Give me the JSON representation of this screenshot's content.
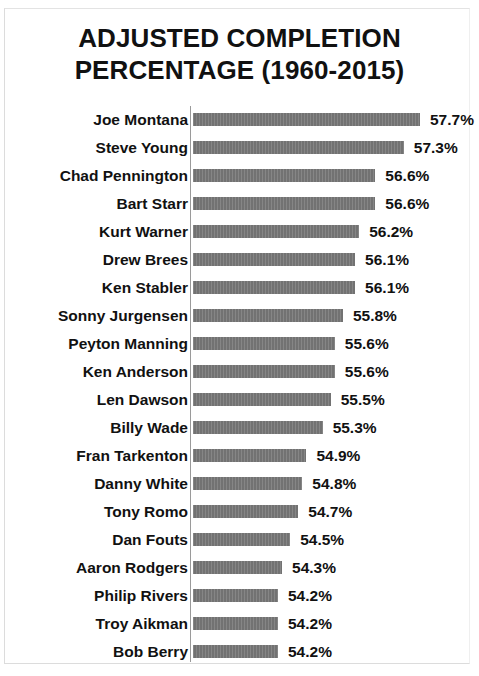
{
  "chart_data": {
    "type": "bar",
    "orientation": "horizontal",
    "title": "ADJUSTED COMPLETION PERCENTAGE (1960-2015)",
    "title_lines": [
      "ADJUSTED COMPLETION",
      "PERCENTAGE (1960-2015)"
    ],
    "xlabel": "",
    "ylabel": "",
    "grid": false,
    "legend": null,
    "axis_min_implied": 52.1,
    "xlim": [
      52.1,
      57.9
    ],
    "bar_color": "#787878",
    "axis_color": "#9a9a9a",
    "text_color": "#111111",
    "value_suffix": "%",
    "categories": [
      "Joe Montana",
      "Steve Young",
      "Chad Pennington",
      "Bart Starr",
      "Kurt Warner",
      "Drew Brees",
      "Ken Stabler",
      "Sonny Jurgensen",
      "Peyton Manning",
      "Ken Anderson",
      "Len Dawson",
      "Billy Wade",
      "Fran Tarkenton",
      "Danny White",
      "Tony Romo",
      "Dan Fouts",
      "Aaron Rodgers",
      "Philip Rivers",
      "Troy Aikman",
      "Bob Berry"
    ],
    "values": [
      57.7,
      57.3,
      56.6,
      56.6,
      56.2,
      56.1,
      56.1,
      55.8,
      55.6,
      55.6,
      55.5,
      55.3,
      54.9,
      54.8,
      54.7,
      54.5,
      54.3,
      54.2,
      54.2,
      54.2
    ],
    "value_labels": [
      "57.7%",
      "57.3%",
      "56.6%",
      "56.6%",
      "56.2%",
      "56.1%",
      "56.1%",
      "55.8%",
      "55.6%",
      "55.6%",
      "55.5%",
      "55.3%",
      "54.9%",
      "54.8%",
      "54.7%",
      "54.5%",
      "54.3%",
      "54.2%",
      "54.2%",
      "54.2%"
    ]
  }
}
